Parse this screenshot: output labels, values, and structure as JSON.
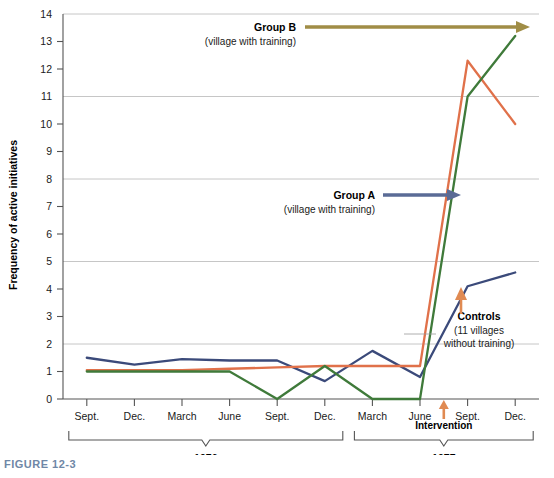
{
  "figure": {
    "caption": "FIGURE 12-3"
  },
  "chart_data": {
    "type": "line",
    "title": "",
    "xlabel": "",
    "ylabel": "Frequency of active initiatives",
    "ylim": [
      0,
      14
    ],
    "yticks": [
      0,
      1,
      2,
      3,
      4,
      5,
      6,
      7,
      8,
      9,
      10,
      11,
      12,
      13,
      14
    ],
    "gridlines": [
      2,
      5,
      8,
      11,
      14
    ],
    "grid": true,
    "legend_position": "inline-annotations",
    "categories": [
      "Sept.",
      "Dec.",
      "March",
      "June",
      "Sept.",
      "Dec.",
      "March",
      "June",
      "Sept.",
      "Dec."
    ],
    "series": [
      {
        "name": "Controls",
        "color": "#3b4a7a",
        "values": [
          1.5,
          1.25,
          1.45,
          1.4,
          1.4,
          0.65,
          1.75,
          0.8,
          4.1,
          4.6
        ]
      },
      {
        "name": "Group A",
        "color": "#e0714a",
        "values": [
          1.05,
          1.05,
          1.05,
          1.1,
          1.15,
          1.2,
          1.2,
          1.2,
          12.3,
          10.0
        ]
      },
      {
        "name": "Group B",
        "color": "#3f7a3a",
        "values": [
          1.0,
          1.0,
          1.0,
          1.0,
          0.0,
          1.2,
          0.0,
          0.0,
          11.0,
          13.2
        ]
      }
    ],
    "annotations": [
      {
        "id": "group-b",
        "title": "Group B",
        "subtitle": "(village with training)",
        "arrow_color": "#a08d46"
      },
      {
        "id": "group-a",
        "title": "Group A",
        "subtitle": "(village with training)",
        "arrow_color": "#5a6b96"
      },
      {
        "id": "controls",
        "title": "Controls",
        "subtitle_line1": "(11 villages",
        "subtitle_line2": "without training)",
        "arrow_color": "#e08a52"
      },
      {
        "id": "intervention",
        "label": "Intervention",
        "arrow_color": "#e08a52"
      }
    ],
    "periods": [
      {
        "label": "1976",
        "start_index": 0,
        "end_index": 5
      },
      {
        "label": "1977",
        "start_index": 6,
        "end_index": 9
      }
    ]
  }
}
